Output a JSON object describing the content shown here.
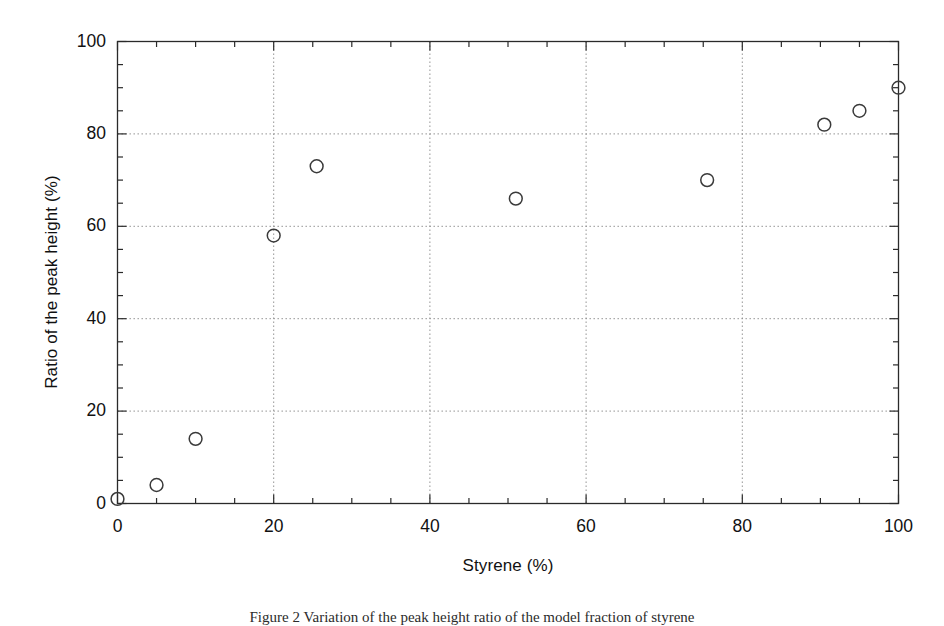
{
  "chart_data": {
    "type": "scatter",
    "title": "",
    "xlabel": "Styrene (%)",
    "ylabel": "Ratio of the peak height (%)",
    "xlim": [
      0,
      100
    ],
    "ylim": [
      0,
      100
    ],
    "xticks": [
      0,
      20,
      40,
      60,
      80,
      100
    ],
    "yticks": [
      0,
      20,
      40,
      60,
      80,
      100
    ],
    "xtick_labels": [
      "0",
      "20",
      "40",
      "60",
      "80",
      "100"
    ],
    "ytick_labels": [
      "0",
      "20",
      "40",
      "60",
      "80",
      "100"
    ],
    "x_minor_tick_interval": 5,
    "y_minor_tick_interval": 5,
    "grid": "dotted gridlines at major ticks",
    "legend": "none",
    "marker": "open circle",
    "marker_color": "#3a3a3a",
    "series": [
      {
        "name": "Ratio of the peak height vs Styrene",
        "points": [
          {
            "x": 0,
            "y": 1
          },
          {
            "x": 5,
            "y": 4
          },
          {
            "x": 10,
            "y": 14
          },
          {
            "x": 20,
            "y": 58
          },
          {
            "x": 25.5,
            "y": 73
          },
          {
            "x": 51,
            "y": 66
          },
          {
            "x": 75.5,
            "y": 70
          },
          {
            "x": 90.5,
            "y": 82
          },
          {
            "x": 95,
            "y": 85
          },
          {
            "x": 100,
            "y": 90
          }
        ]
      }
    ]
  },
  "caption": {
    "text": "Figure 2   Variation of the peak height ratio of the model fraction of styrene"
  }
}
